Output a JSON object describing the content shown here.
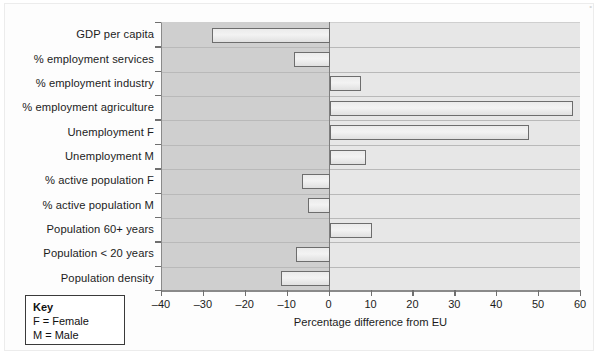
{
  "chart_data": {
    "type": "bar",
    "orientation": "horizontal",
    "title": "",
    "xlabel": "Percentage difference from EU",
    "ylabel": "",
    "xlim": [
      -40,
      60
    ],
    "xticks": [
      -40,
      -30,
      -20,
      -10,
      0,
      10,
      20,
      30,
      40,
      50,
      60
    ],
    "xtick_labels": [
      "–40",
      "–30",
      "–20",
      "–10",
      "0",
      "10",
      "20",
      "30",
      "40",
      "50",
      "60"
    ],
    "grid": true,
    "legend": "none",
    "categories": [
      "GDP per capita",
      "% employment services",
      "% employment industry",
      "% employment agriculture",
      "Unemployment F",
      "Unemployment M",
      "% active population F",
      "% active population M",
      "Population 60+ years",
      "Population < 20 years",
      "Population density"
    ],
    "values": [
      -28,
      -8.5,
      7.5,
      58.2,
      47.5,
      8.8,
      -6.5,
      -5.2,
      10.2,
      -8,
      -11.7
    ]
  },
  "key": {
    "title": "Key",
    "lines": [
      "F = Female",
      "M = Male"
    ]
  },
  "colors": {
    "bar_fill": "#efefef",
    "bar_edge": "#6d6d6d",
    "plot_positive_bg": "#e7e7e7",
    "plot_negative_bg": "#cfcfcf",
    "gridline": "#b9b9b9",
    "axis": "#8a8a8a",
    "text": "#1c1c1c",
    "key_border": "#3a3a3a"
  }
}
